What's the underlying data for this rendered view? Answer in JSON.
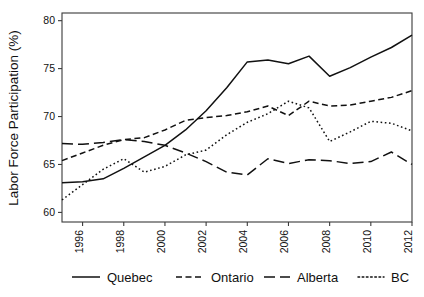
{
  "chart_data": {
    "type": "line",
    "title": "",
    "subtitle": "",
    "xlabel": "",
    "ylabel": "Labor Force Participation (%)",
    "xlim": [
      1995,
      2012
    ],
    "ylim": [
      59.0,
      80.8
    ],
    "grid": false,
    "legend_position": "bottom",
    "x": [
      1995,
      1996,
      1997,
      1998,
      1999,
      2000,
      2001,
      2002,
      2003,
      2004,
      2005,
      2006,
      2007,
      2008,
      2009,
      2010,
      2011,
      2012
    ],
    "xticks": [
      1996,
      1998,
      2000,
      2002,
      2004,
      2006,
      2008,
      2010,
      2012
    ],
    "xticklabels": [
      "1996",
      "1998",
      "2000",
      "2002",
      "2004",
      "2006",
      "2008",
      "2010",
      "2012"
    ],
    "yticks": [
      60,
      65,
      70,
      75,
      80
    ],
    "yticklabels": [
      "60",
      "65",
      "70",
      "75",
      "80"
    ],
    "series": [
      {
        "name": "Quebec",
        "dash": "solid",
        "color": "#111111",
        "values": [
          63.1,
          63.2,
          63.5,
          64.6,
          65.8,
          67.0,
          68.6,
          70.6,
          73.0,
          75.7,
          75.9,
          75.5,
          76.3,
          74.2,
          75.1,
          76.2,
          77.2,
          78.5
        ]
      },
      {
        "name": "Ontario",
        "dash": "dashed",
        "color": "#111111",
        "values": [
          65.4,
          66.2,
          67.0,
          67.6,
          67.8,
          68.6,
          69.6,
          69.9,
          70.1,
          70.5,
          71.1,
          70.1,
          71.6,
          71.1,
          71.2,
          71.6,
          72.0,
          72.7
        ]
      },
      {
        "name": "Alberta",
        "dash": "longdash",
        "color": "#111111",
        "values": [
          67.2,
          67.1,
          67.3,
          67.6,
          67.4,
          67.0,
          66.2,
          65.3,
          64.2,
          63.9,
          65.6,
          65.1,
          65.5,
          65.4,
          65.1,
          65.3,
          66.3,
          65.0
        ]
      },
      {
        "name": "BC",
        "dash": "dotted",
        "color": "#111111",
        "values": [
          61.3,
          62.9,
          64.5,
          65.6,
          64.2,
          64.8,
          66.0,
          66.5,
          68.1,
          69.4,
          70.3,
          71.6,
          70.9,
          67.4,
          68.4,
          69.5,
          69.3,
          68.5
        ]
      }
    ]
  },
  "legend": {
    "items": [
      {
        "label": "Quebec"
      },
      {
        "label": "Ontario"
      },
      {
        "label": "Alberta"
      },
      {
        "label": "BC"
      }
    ]
  }
}
